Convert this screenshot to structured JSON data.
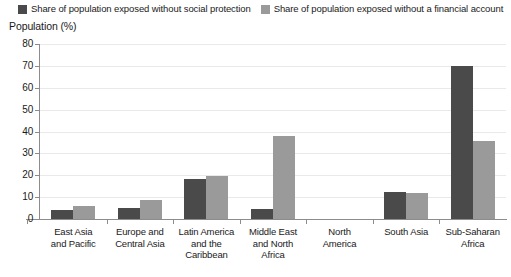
{
  "legend": {
    "items": [
      {
        "label": "Share of population exposed without social protection",
        "color": "#4a4a4a",
        "icon": "square-swatch-icon"
      },
      {
        "label": "Share of population exposed without a financial account",
        "color": "#9a9a9a",
        "icon": "square-swatch-icon"
      }
    ]
  },
  "chart_data": {
    "type": "bar",
    "title": "",
    "xlabel": "",
    "ylabel": "Population (%)",
    "ylim": [
      0,
      80
    ],
    "yticks": [
      0,
      10,
      20,
      30,
      40,
      50,
      60,
      70,
      80
    ],
    "grid": true,
    "legend_position": "top-left",
    "categories": [
      "East Asia and Pacific",
      "Europe and Central Asia",
      "Latin America and the Caribbean",
      "Middle East and North Africa",
      "North America",
      "South Asia",
      "Sub-Saharan Africa"
    ],
    "category_lines": [
      [
        "East Asia",
        "and Pacific"
      ],
      [
        "Europe and",
        "Central Asia"
      ],
      [
        "Latin America",
        "and the",
        "Caribbean"
      ],
      [
        "Middle East",
        "and North",
        "Africa"
      ],
      [
        "North",
        "America"
      ],
      [
        "South Asia"
      ],
      [
        "Sub-Saharan",
        "Africa"
      ]
    ],
    "series": [
      {
        "name": "Share of population exposed without social protection",
        "color": "#4a4a4a",
        "values": [
          4,
          5,
          18.5,
          4.5,
          0,
          12.5,
          70
        ]
      },
      {
        "name": "Share of population exposed without a financial account",
        "color": "#9a9a9a",
        "values": [
          6,
          8.5,
          19.5,
          38,
          0,
          12,
          35.5
        ]
      }
    ]
  }
}
